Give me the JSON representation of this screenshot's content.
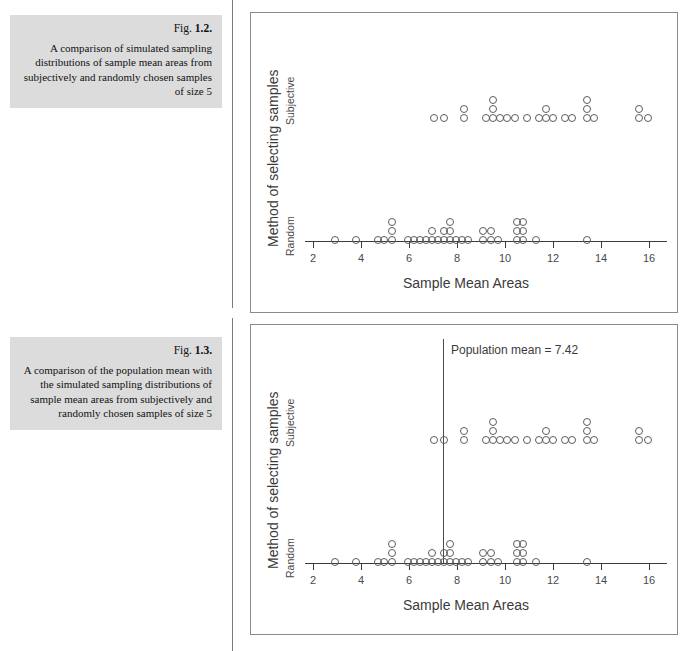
{
  "figures": [
    {
      "fig_label_prefix": "Fig. ",
      "fig_number": "1.2.",
      "caption": "A comparison of simulated sampling distributions of sample mean areas from subjectively and randomly chosen samples of size 5",
      "y_title": "Method of selecting samples",
      "y_categories": [
        "Subjective",
        "Random"
      ],
      "x_title": "Sample Mean Areas",
      "x_ticks": [
        "2",
        "4",
        "6",
        "8",
        "10",
        "12",
        "14",
        "16"
      ],
      "mean_label": ""
    },
    {
      "fig_label_prefix": "Fig. ",
      "fig_number": "1.3.",
      "caption": "A comparison of the population mean with the simulated sampling distributions of sample mean areas from subjectively and randomly chosen samples of size 5",
      "y_title": "Method of selecting samples",
      "y_categories": [
        "Subjective",
        "Random"
      ],
      "x_title": "Sample Mean Areas",
      "x_ticks": [
        "2",
        "4",
        "6",
        "8",
        "10",
        "12",
        "14",
        "16"
      ],
      "mean_label": "Population mean = 7.42"
    }
  ],
  "colors": {
    "caption_background": "#dcdcdc",
    "dot_stroke": "#5d5d5d",
    "axis": "#3b3b3b",
    "frame": "#8a8a8a",
    "text": "#3b3b3b"
  },
  "chart_data": {
    "type": "scatter",
    "title": "A comparison of simulated sampling distributions of sample mean areas from subjectively and randomly chosen samples of size 5",
    "xlabel": "Sample Mean Areas",
    "ylabel": "Method of selecting samples",
    "xlim": [
      1.2,
      17.0
    ],
    "xticks": [
      2,
      4,
      6,
      8,
      10,
      12,
      14,
      16
    ],
    "grid": false,
    "legend": "none",
    "note": "Two identical stacked dotplots; Fig 1.3 adds a vertical reference line at the population mean 7.42",
    "population_mean": 7.42,
    "series": [
      {
        "name": "Subjective",
        "values": [
          7.1,
          7.4,
          8.3,
          8.3,
          8.6,
          9.2,
          9.2,
          9.2,
          9.5,
          9.8,
          10.1,
          10.4,
          10.4,
          10.7,
          11.0,
          11.0,
          11.3,
          11.3,
          11.6,
          11.6,
          11.9,
          12.2,
          12.5,
          13.3,
          13.3,
          13.3,
          13.6,
          13.9,
          15.7,
          15.7,
          16.0
        ]
      },
      {
        "name": "Random",
        "values": [
          2.9,
          3.8,
          4.7,
          4.7,
          5.0,
          5.3,
          5.3,
          5.3,
          5.6,
          5.9,
          6.2,
          6.2,
          6.5,
          6.5,
          6.8,
          6.8,
          7.1,
          7.1,
          7.1,
          7.4,
          7.4,
          7.4,
          7.7,
          7.7,
          8.0,
          8.3,
          8.6,
          9.2,
          9.2,
          9.5,
          9.5,
          9.8,
          10.4,
          10.4,
          10.7,
          10.7,
          10.7,
          11.3,
          13.4
        ]
      }
    ],
    "stacks": {
      "Subjective": [
        {
          "x": 7.05,
          "n": 1
        },
        {
          "x": 7.45,
          "n": 1
        },
        {
          "x": 8.3,
          "n": 2
        },
        {
          "x": 9.2,
          "n": 1
        },
        {
          "x": 9.5,
          "n": 3
        },
        {
          "x": 9.8,
          "n": 1
        },
        {
          "x": 10.1,
          "n": 1
        },
        {
          "x": 10.4,
          "n": 1
        },
        {
          "x": 10.9,
          "n": 1
        },
        {
          "x": 11.4,
          "n": 1
        },
        {
          "x": 11.7,
          "n": 2
        },
        {
          "x": 12.0,
          "n": 1
        },
        {
          "x": 12.5,
          "n": 1
        },
        {
          "x": 12.8,
          "n": 1
        },
        {
          "x": 13.4,
          "n": 3
        },
        {
          "x": 13.7,
          "n": 1
        },
        {
          "x": 15.6,
          "n": 2
        },
        {
          "x": 15.95,
          "n": 1
        }
      ],
      "Random": [
        {
          "x": 2.9,
          "n": 1
        },
        {
          "x": 3.8,
          "n": 1
        },
        {
          "x": 4.7,
          "n": 1
        },
        {
          "x": 4.95,
          "n": 1
        },
        {
          "x": 5.3,
          "n": 3
        },
        {
          "x": 5.95,
          "n": 1
        },
        {
          "x": 6.2,
          "n": 1
        },
        {
          "x": 6.45,
          "n": 1
        },
        {
          "x": 6.7,
          "n": 1
        },
        {
          "x": 6.95,
          "n": 2
        },
        {
          "x": 7.2,
          "n": 1
        },
        {
          "x": 7.45,
          "n": 2
        },
        {
          "x": 7.7,
          "n": 3
        },
        {
          "x": 7.95,
          "n": 1
        },
        {
          "x": 8.2,
          "n": 1
        },
        {
          "x": 8.45,
          "n": 1
        },
        {
          "x": 9.1,
          "n": 2
        },
        {
          "x": 9.4,
          "n": 2
        },
        {
          "x": 9.7,
          "n": 1
        },
        {
          "x": 10.5,
          "n": 3
        },
        {
          "x": 10.75,
          "n": 3
        },
        {
          "x": 11.3,
          "n": 1
        },
        {
          "x": 13.4,
          "n": 1
        }
      ]
    }
  }
}
